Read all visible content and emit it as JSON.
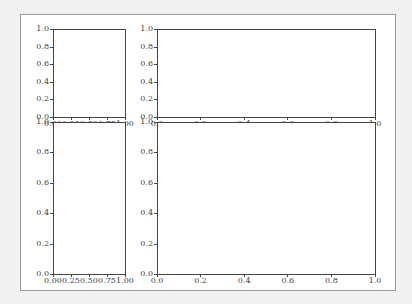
{
  "chart_data": [
    {
      "type": "line",
      "position": "top-left",
      "title": "",
      "xlabel": "",
      "ylabel": "",
      "xlim": [
        0.0,
        1.0
      ],
      "ylim": [
        0.0,
        1.0
      ],
      "xticks": [
        "0.00",
        "0.25",
        "0.50",
        "0.75",
        "1.00"
      ],
      "yticks": [
        "0.0",
        "0.2",
        "0.4",
        "0.6",
        "0.8",
        "1.0"
      ],
      "series": [],
      "grid": false
    },
    {
      "type": "line",
      "position": "top-right",
      "title": "",
      "xlabel": "",
      "ylabel": "",
      "xlim": [
        0.0,
        1.0
      ],
      "ylim": [
        0.0,
        1.0
      ],
      "xticks": [
        "0.0",
        "0.2",
        "0.4",
        "0.6",
        "0.8",
        "1.0"
      ],
      "yticks": [
        "0.0",
        "0.2",
        "0.4",
        "0.6",
        "0.8",
        "1.0"
      ],
      "series": [],
      "grid": false
    },
    {
      "type": "line",
      "position": "bottom-left",
      "title": "",
      "xlabel": "",
      "ylabel": "",
      "xlim": [
        0.0,
        1.0
      ],
      "ylim": [
        0.0,
        1.0
      ],
      "xticks": [
        "0.00",
        "0.25",
        "0.50",
        "0.75",
        "1.00"
      ],
      "yticks": [
        "0.0",
        "0.2",
        "0.4",
        "0.6",
        "0.8",
        "1.0"
      ],
      "series": [],
      "grid": false
    },
    {
      "type": "line",
      "position": "bottom-right",
      "title": "",
      "xlabel": "",
      "ylabel": "",
      "xlim": [
        0.0,
        1.0
      ],
      "ylim": [
        0.0,
        1.0
      ],
      "xticks": [
        "0.0",
        "0.2",
        "0.4",
        "0.6",
        "0.8",
        "1.0"
      ],
      "yticks": [
        "0.0",
        "0.2",
        "0.4",
        "0.6",
        "0.8",
        "1.0"
      ],
      "series": [],
      "grid": false
    }
  ],
  "colors": {
    "background": "#f1f1f1",
    "figure": "#ffffff",
    "axis": "#444444"
  }
}
